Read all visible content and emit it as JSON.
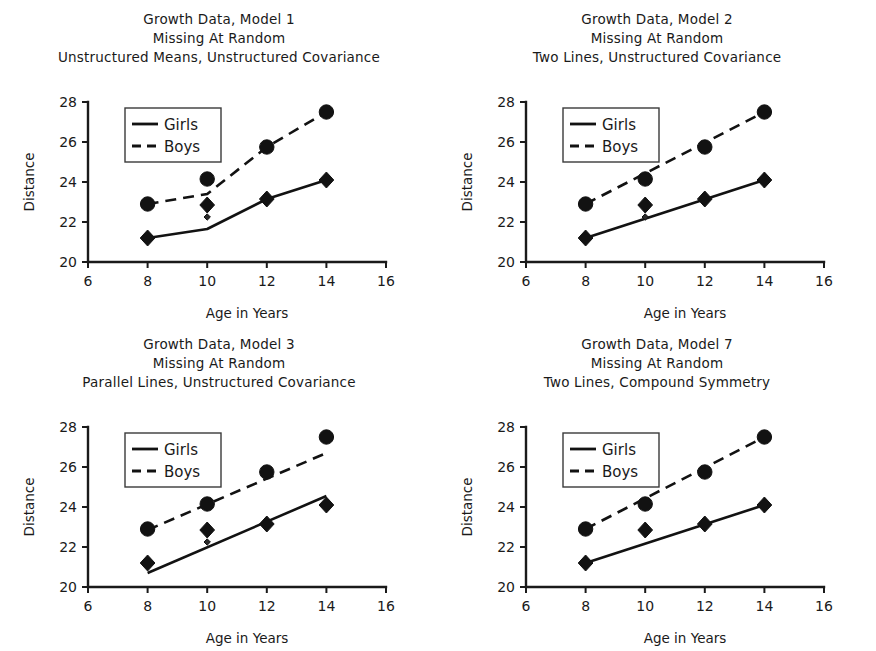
{
  "figure": {
    "panel_count": 4,
    "layout": "2x2",
    "shared_axis": {
      "xlabel": "Age in Years",
      "ylabel": "Distance"
    },
    "legend": {
      "girls_label": "Girls",
      "boys_label": "Boys"
    },
    "colors": {
      "ink": "#121212",
      "background": "#ffffff"
    }
  },
  "chart_data": [
    {
      "type": "line",
      "panel": 1,
      "title": "Growth Data, Model 1",
      "subtitle": "Missing At Random",
      "subtitle2": "Unstructured Means, Unstructured Covariance",
      "xlabel": "Age in Years",
      "ylabel": "Distance",
      "xlim": [
        6,
        16
      ],
      "ylim": [
        20,
        28
      ],
      "xticks": [
        6,
        8,
        10,
        12,
        14,
        16
      ],
      "yticks": [
        20,
        22,
        24,
        26,
        28
      ],
      "grid": false,
      "legend_position": "top-left-inside",
      "x": [
        8,
        10,
        12,
        14
      ],
      "series": [
        {
          "name": "Girls",
          "style": "solid",
          "marker": "diamond",
          "values": [
            21.2,
            22.85,
            23.15,
            24.1
          ]
        },
        {
          "name": "Boys",
          "style": "dashed",
          "marker": "circle",
          "values": [
            22.9,
            24.15,
            25.75,
            27.5
          ]
        }
      ],
      "fitted": {
        "Girls": {
          "x": [
            8,
            10,
            12,
            14
          ],
          "y": [
            21.2,
            21.65,
            23.15,
            24.1
          ]
        },
        "Boys": {
          "x": [
            8,
            10,
            12,
            14
          ],
          "y": [
            22.9,
            23.4,
            25.75,
            27.5
          ]
        }
      },
      "extra_markers": [
        {
          "series": "Girls",
          "x": 10,
          "y": 22.25,
          "size": "small"
        },
        {
          "series": "Boys",
          "x": 10,
          "y": 24.15,
          "size": "small"
        }
      ]
    },
    {
      "type": "line",
      "panel": 2,
      "title": "Growth Data, Model 2",
      "subtitle": "Missing At Random",
      "subtitle2": "Two Lines, Unstructured Covariance",
      "xlabel": "Age in Years",
      "ylabel": "Distance",
      "xlim": [
        6,
        16
      ],
      "ylim": [
        20,
        28
      ],
      "xticks": [
        6,
        8,
        10,
        12,
        14,
        16
      ],
      "yticks": [
        20,
        22,
        24,
        26,
        28
      ],
      "grid": false,
      "legend_position": "top-left-inside",
      "x": [
        8,
        10,
        12,
        14
      ],
      "series": [
        {
          "name": "Girls",
          "style": "solid",
          "marker": "diamond",
          "values": [
            21.2,
            22.85,
            23.15,
            24.1
          ]
        },
        {
          "name": "Boys",
          "style": "dashed",
          "marker": "circle",
          "values": [
            22.9,
            24.15,
            25.75,
            27.5
          ]
        }
      ],
      "fitted": {
        "Girls": {
          "x": [
            8,
            14
          ],
          "y": [
            21.2,
            24.1
          ]
        },
        "Boys": {
          "x": [
            8,
            14
          ],
          "y": [
            22.9,
            27.5
          ]
        }
      },
      "extra_markers": [
        {
          "series": "Girls",
          "x": 10,
          "y": 22.25,
          "size": "small"
        }
      ]
    },
    {
      "type": "line",
      "panel": 3,
      "title": "Growth Data, Model 3",
      "subtitle": "Missing At Random",
      "subtitle2": "Parallel Lines, Unstructured Covariance",
      "xlabel": "Age in Years",
      "ylabel": "Distance",
      "xlim": [
        6,
        16
      ],
      "ylim": [
        20,
        28
      ],
      "xticks": [
        6,
        8,
        10,
        12,
        14,
        16
      ],
      "yticks": [
        20,
        22,
        24,
        26,
        28
      ],
      "grid": false,
      "legend_position": "top-left-inside",
      "x": [
        8,
        10,
        12,
        14
      ],
      "series": [
        {
          "name": "Girls",
          "style": "solid",
          "marker": "diamond",
          "values": [
            21.2,
            22.85,
            23.15,
            24.1
          ]
        },
        {
          "name": "Boys",
          "style": "dashed",
          "marker": "circle",
          "values": [
            22.9,
            24.15,
            25.75,
            27.5
          ]
        }
      ],
      "fitted": {
        "Girls": {
          "x": [
            8,
            14
          ],
          "y": [
            20.7,
            24.55
          ]
        },
        "Boys": {
          "x": [
            8,
            14
          ],
          "y": [
            22.85,
            26.7
          ]
        }
      },
      "extra_markers": [
        {
          "series": "Girls",
          "x": 10,
          "y": 22.25,
          "size": "small"
        }
      ]
    },
    {
      "type": "line",
      "panel": 7,
      "title": "Growth Data, Model 7",
      "subtitle": "Missing At Random",
      "subtitle2": "Two Lines, Compound Symmetry",
      "xlabel": "Age in Years",
      "ylabel": "Distance",
      "xlim": [
        6,
        16
      ],
      "ylim": [
        20,
        28
      ],
      "xticks": [
        6,
        8,
        10,
        12,
        14,
        16
      ],
      "yticks": [
        20,
        22,
        24,
        26,
        28
      ],
      "grid": false,
      "legend_position": "top-left-inside",
      "x": [
        8,
        10,
        12,
        14
      ],
      "series": [
        {
          "name": "Girls",
          "style": "solid",
          "marker": "diamond",
          "values": [
            21.2,
            22.85,
            23.15,
            24.1
          ]
        },
        {
          "name": "Boys",
          "style": "dashed",
          "marker": "circle",
          "values": [
            22.9,
            24.15,
            25.75,
            27.5
          ]
        }
      ],
      "fitted": {
        "Girls": {
          "x": [
            8,
            14
          ],
          "y": [
            21.2,
            24.1
          ]
        },
        "Boys": {
          "x": [
            8,
            14
          ],
          "y": [
            22.9,
            27.5
          ]
        }
      },
      "extra_markers": []
    }
  ]
}
